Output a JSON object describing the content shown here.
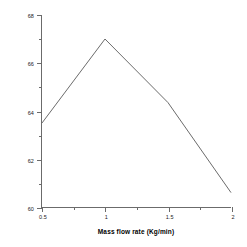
{
  "chart_data": {
    "type": "line",
    "title": "",
    "xlabel": "Mass flow rate (Kg/min)",
    "ylabel": "Average efficiency η(%)",
    "x": [
      0.5,
      1.0,
      1.5,
      2.0
    ],
    "values": [
      63.5,
      67.0,
      64.35,
      60.6
    ],
    "series": [
      {
        "name": "Average efficiency",
        "x": [
          0.5,
          1.0,
          1.5,
          2.0
        ],
        "values": [
          63.5,
          67.0,
          64.35,
          60.6
        ]
      }
    ],
    "xlim": [
      0.5,
      2.0
    ],
    "ylim": [
      60,
      68
    ],
    "x_ticks": [
      0.5,
      1.0,
      1.5,
      2.0
    ],
    "x_tick_labels": [
      "0.5",
      "1",
      "1.5",
      "2"
    ],
    "y_ticks": [
      60,
      62,
      64,
      66,
      68
    ],
    "y_tick_labels": [
      "60",
      "62",
      "64",
      "66",
      "68"
    ],
    "y_minor_ticks": [
      61,
      63,
      65,
      67
    ],
    "x_minor_ticks": [
      0.75,
      1.25,
      1.75
    ],
    "grid": false,
    "legend": false,
    "legend_position": "none",
    "line_color": "#6b6b6b",
    "axis_color": "#6b6b6b",
    "background_color": "#ffffff",
    "markers": false,
    "annotations": []
  },
  "axis_titles": {
    "x": "Mass flow rate (Kg/min)",
    "y": "Average efficiency η(%)"
  }
}
